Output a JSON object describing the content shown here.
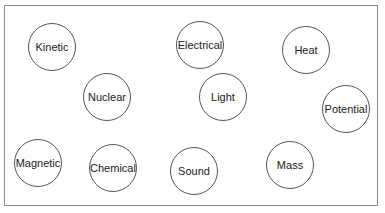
{
  "diagram": {
    "type": "concept-bubbles",
    "nodes": [
      {
        "label": "Kinetic",
        "x": 52,
        "y": 47
      },
      {
        "label": "Electrical",
        "x": 200,
        "y": 45
      },
      {
        "label": "Heat",
        "x": 306,
        "y": 50
      },
      {
        "label": "Nuclear",
        "x": 107,
        "y": 97
      },
      {
        "label": "Light",
        "x": 223,
        "y": 97
      },
      {
        "label": "Potential",
        "x": 346,
        "y": 109
      },
      {
        "label": "Magnetic",
        "x": 38,
        "y": 163
      },
      {
        "label": "Chemical",
        "x": 113,
        "y": 168
      },
      {
        "label": "Sound",
        "x": 194,
        "y": 171
      },
      {
        "label": "Mass",
        "x": 290,
        "y": 165
      }
    ]
  }
}
